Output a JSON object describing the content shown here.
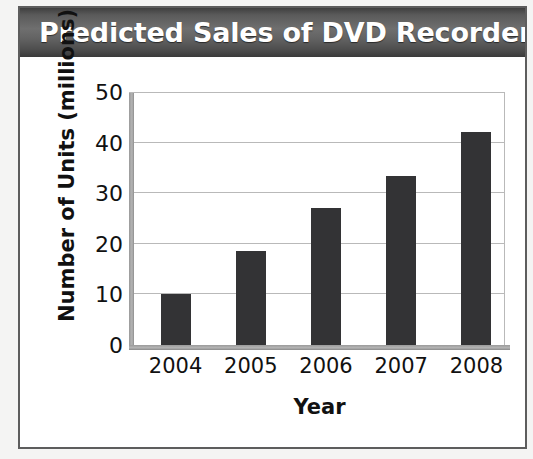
{
  "figure": {
    "title": "Predicted Sales of DVD Recorders",
    "frame_color": "#5d5d5d",
    "title_bar_color": "#5a5a5a",
    "title_text_color": "#ffffff",
    "background": "#ffffff"
  },
  "chart_data": {
    "type": "bar",
    "title": "Predicted Sales of DVD Recorders",
    "xlabel": "Year",
    "ylabel": "Number of Units (millions)",
    "categories": [
      "2004",
      "2005",
      "2006",
      "2007",
      "2008"
    ],
    "values": [
      10,
      18.5,
      27,
      33.5,
      42
    ],
    "ylim": [
      0,
      50
    ],
    "yticks": [
      0,
      10,
      20,
      30,
      40,
      50
    ],
    "ytick_labels": [
      "0",
      "10",
      "20",
      "30",
      "40",
      "50"
    ],
    "grid": "horizontal",
    "legend": "none",
    "bar_color": "#333335",
    "gridline_color": "#b9b9b9",
    "axis_color": "#9a9a9a"
  }
}
